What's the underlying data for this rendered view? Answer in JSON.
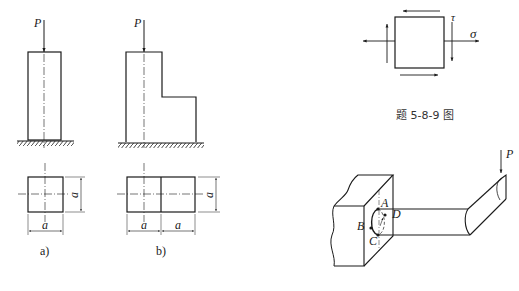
{
  "figures": {
    "a": {
      "caption": "a)",
      "load_label": "P",
      "dim_width": "a",
      "dim_height": "a"
    },
    "b": {
      "caption": "b)",
      "load_label": "P",
      "dim_width_left": "a",
      "dim_width_right": "a",
      "dim_height": "a"
    },
    "stress_element": {
      "shear_label": "τ",
      "normal_label": "σ",
      "caption": "题 5-8-9 图"
    },
    "bent_bar": {
      "load_label": "P",
      "points": [
        "A",
        "B",
        "C",
        "D"
      ]
    }
  }
}
